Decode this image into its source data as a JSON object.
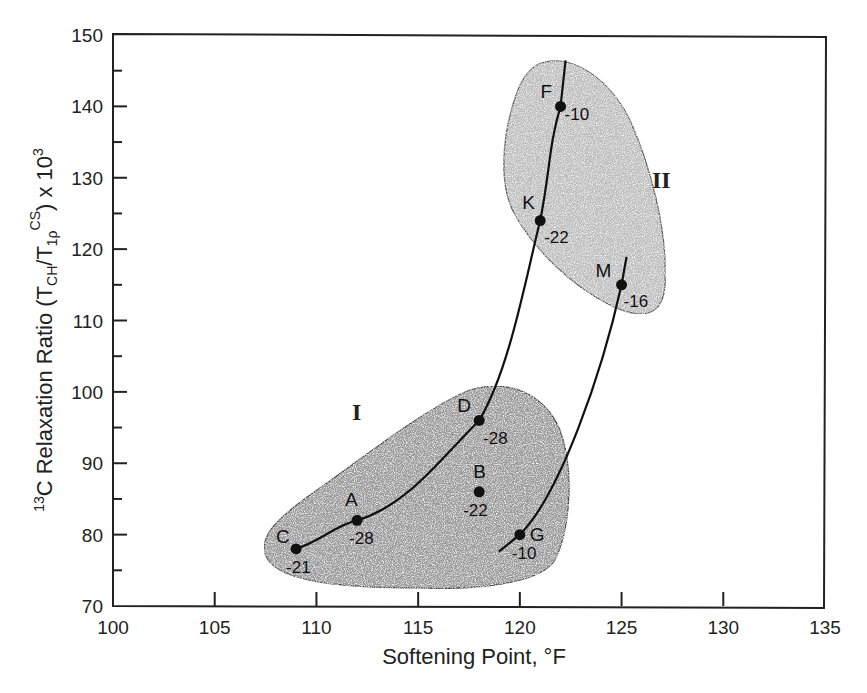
{
  "chart_data": {
    "type": "scatter",
    "title": "",
    "xlabel": "Softening Point, °F",
    "ylabel": "13C Relaxation Ratio (TCH/T1ρCS) x 10^3",
    "xlim": [
      100,
      135
    ],
    "ylim": [
      70,
      150
    ],
    "x_ticks": [
      100,
      105,
      110,
      115,
      120,
      125,
      130,
      135
    ],
    "y_ticks": [
      70,
      80,
      90,
      100,
      110,
      120,
      130,
      140,
      150
    ],
    "grid": false,
    "legend": null,
    "points": [
      {
        "label": "C",
        "x": 109,
        "y": 78,
        "annotation": "-21"
      },
      {
        "label": "A",
        "x": 112,
        "y": 82,
        "annotation": "-28"
      },
      {
        "label": "D",
        "x": 118,
        "y": 96,
        "annotation": "-28"
      },
      {
        "label": "B",
        "x": 118,
        "y": 86,
        "annotation": "-22"
      },
      {
        "label": "G",
        "x": 120,
        "y": 80,
        "annotation": "-10"
      },
      {
        "label": "K",
        "x": 121,
        "y": 124,
        "annotation": "-22"
      },
      {
        "label": "F",
        "x": 122,
        "y": 140,
        "annotation": "-10"
      },
      {
        "label": "M",
        "x": 125,
        "y": 115,
        "annotation": "-16"
      }
    ],
    "curves": [
      {
        "name": "curve-1",
        "through": [
          "C",
          "A",
          "D",
          "K",
          "F"
        ]
      },
      {
        "name": "curve-2",
        "through": [
          "G",
          "M"
        ]
      }
    ],
    "regions": [
      {
        "name": "I",
        "members": [
          "C",
          "A",
          "D",
          "B",
          "G"
        ],
        "fill": "#9a9a9a"
      },
      {
        "name": "II",
        "members": [
          "F",
          "K",
          "M"
        ],
        "fill": "#bdbdbd"
      }
    ]
  },
  "labels": {
    "xlabel_text": "Softening Point, °F",
    "ylabel_prefix": "13",
    "ylabel_main": "C Relaxation Ratio (T",
    "ylabel_sub1": "CH",
    "ylabel_mid": "/T",
    "ylabel_sub2": "1ρ",
    "ylabel_sup": "CS",
    "ylabel_tail": ") x 10",
    "ylabel_exp": "3",
    "region_I": "I",
    "region_II": "II"
  }
}
